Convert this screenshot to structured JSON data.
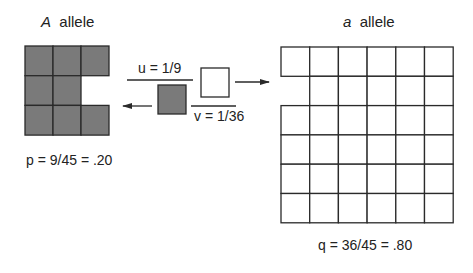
{
  "diagram": {
    "left": {
      "symbol": "A",
      "label": "allele",
      "equation": "p = 9/45 = .20",
      "grid": {
        "rows": 3,
        "cols": 3,
        "missing": [
          [
            1,
            2
          ]
        ],
        "fill": "#7a7a7a"
      }
    },
    "right": {
      "symbol": "a",
      "label": "allele",
      "equation": "q = 36/45 = .80",
      "grid": {
        "rows": 6,
        "cols": 6,
        "missing": [
          [
            1,
            0
          ]
        ],
        "fill": "#ffffff"
      }
    },
    "mutation_forward": {
      "label": "u = 1/9",
      "direction": "A to a"
    },
    "mutation_back": {
      "label": "v = 1/36",
      "direction": "a to A"
    },
    "colors": {
      "line": "#2a2a2a",
      "gray": "#7a7a7a",
      "white": "#ffffff"
    }
  }
}
